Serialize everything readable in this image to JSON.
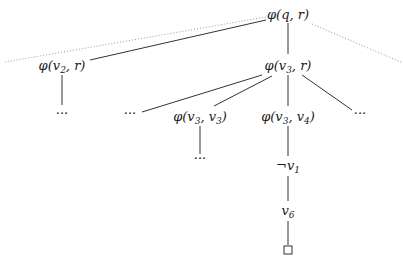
{
  "diagram": {
    "type": "tree",
    "nodes": {
      "root": {
        "label": "φ(q, r)",
        "fn": "φ",
        "args": [
          "q",
          "r"
        ]
      },
      "n_v2r": {
        "label": "φ(v2, r)",
        "fn": "φ",
        "args_main": "v",
        "sub": "2",
        "rest": ", r)"
      },
      "n_v3r": {
        "label": "φ(v3, r)",
        "sub": "3"
      },
      "n_v2r_child": {
        "label": "···"
      },
      "n_v3r_c1": {
        "label": "···"
      },
      "n_v3v3": {
        "label": "φ(v3, v3)",
        "sub1": "3",
        "sub2": "3"
      },
      "n_v3v4": {
        "label": "φ(v3, v4)",
        "sub1": "3",
        "sub2": "4"
      },
      "n_v3r_c4": {
        "label": "···"
      },
      "n_v3v3_child": {
        "label": "···"
      },
      "n_not_v1": {
        "label": "¬v1",
        "neg": "¬",
        "var": "v",
        "sub": "1"
      },
      "n_v6": {
        "label": "v6",
        "var": "v",
        "sub": "6"
      },
      "n_leaf": {
        "label": "□",
        "meaning": "closed branch"
      }
    },
    "edges": [
      {
        "from": "root",
        "to": "n_v2r",
        "style": "solid"
      },
      {
        "from": "root",
        "to": "n_v3r",
        "style": "solid"
      },
      {
        "from": "root",
        "to": "left-edge",
        "style": "dotted"
      },
      {
        "from": "root",
        "to": "right-edge",
        "style": "dotted"
      },
      {
        "from": "n_v2r",
        "to": "n_v2r_child",
        "style": "solid"
      },
      {
        "from": "n_v3r",
        "to": "n_v3r_c1",
        "style": "solid"
      },
      {
        "from": "n_v3r",
        "to": "n_v3v3",
        "style": "solid"
      },
      {
        "from": "n_v3r",
        "to": "n_v3v4",
        "style": "solid"
      },
      {
        "from": "n_v3r",
        "to": "n_v3r_c4",
        "style": "solid"
      },
      {
        "from": "n_v3v3",
        "to": "n_v3v3_child",
        "style": "solid"
      },
      {
        "from": "n_v3v4",
        "to": "n_not_v1",
        "style": "solid"
      },
      {
        "from": "n_not_v1",
        "to": "n_v6",
        "style": "solid"
      },
      {
        "from": "n_v6",
        "to": "n_leaf",
        "style": "solid"
      }
    ],
    "text": {
      "phi": "φ",
      "lparen": "(",
      "rparen": ")",
      "comma": ", ",
      "q": "q",
      "r": "r",
      "v": "v",
      "neg": "¬",
      "dots": "···",
      "s1": "1",
      "s2": "2",
      "s3": "3",
      "s4": "4",
      "s6": "6"
    }
  }
}
